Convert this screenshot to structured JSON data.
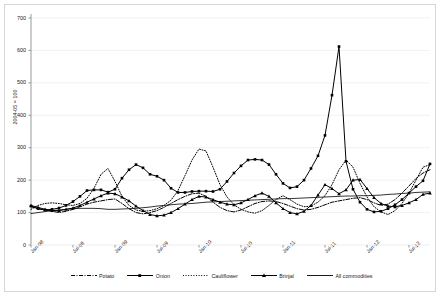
{
  "chart_data": {
    "type": "line",
    "title": "",
    "xlabel": "",
    "ylabel": "2004-05 = 100",
    "ylim": [
      0,
      700
    ],
    "yticks": [
      0,
      100,
      200,
      300,
      400,
      500,
      600,
      700
    ],
    "grid": true,
    "legend_position": "bottom",
    "x_tick_labels": [
      "Jan-08",
      "Jul-08",
      "Jan-09",
      "Jul-09",
      "Jan-10",
      "Jul-10",
      "Jan-11",
      "Jul-11",
      "Jan-12",
      "Jul-12"
    ],
    "x_tick_indices": [
      0,
      6,
      12,
      18,
      24,
      30,
      36,
      42,
      48,
      54
    ],
    "x": [
      "Jan-08",
      "Feb-08",
      "Mar-08",
      "Apr-08",
      "May-08",
      "Jun-08",
      "Jul-08",
      "Aug-08",
      "Sep-08",
      "Oct-08",
      "Nov-08",
      "Dec-08",
      "Jan-09",
      "Feb-09",
      "Mar-09",
      "Apr-09",
      "May-09",
      "Jun-09",
      "Jul-09",
      "Aug-09",
      "Sep-09",
      "Oct-09",
      "Nov-09",
      "Dec-09",
      "Jan-10",
      "Feb-10",
      "Mar-10",
      "Apr-10",
      "May-10",
      "Jun-10",
      "Jul-10",
      "Aug-10",
      "Sep-10",
      "Oct-10",
      "Nov-10",
      "Dec-10",
      "Jan-11",
      "Feb-11",
      "Mar-11",
      "Apr-11",
      "May-11",
      "Jun-11",
      "Jul-11",
      "Aug-11",
      "Sep-11",
      "Oct-11",
      "Nov-11",
      "Dec-11",
      "Jan-12",
      "Feb-12",
      "Mar-12",
      "Apr-12",
      "May-12",
      "Jun-12",
      "Jul-12",
      "Aug-12",
      "Sep-12",
      "Oct-12"
    ],
    "series": [
      {
        "name": "Potato",
        "style": "dash-dot",
        "marker": "none",
        "values": [
          118,
          112,
          108,
          104,
          100,
          104,
          110,
          118,
          126,
          132,
          136,
          140,
          142,
          128,
          112,
          100,
          96,
          100,
          106,
          116,
          128,
          140,
          150,
          158,
          160,
          150,
          132,
          116,
          106,
          102,
          108,
          118,
          128,
          134,
          136,
          134,
          128,
          120,
          112,
          108,
          110,
          116,
          124,
          132,
          136,
          140,
          144,
          146,
          140,
          130,
          122,
          126,
          140,
          160,
          182,
          205,
          222,
          232
        ]
      },
      {
        "name": "Onion",
        "style": "solid",
        "marker": "square",
        "values": [
          120,
          112,
          108,
          110,
          114,
          122,
          134,
          150,
          168,
          170,
          170,
          163,
          172,
          206,
          232,
          248,
          238,
          218,
          212,
          200,
          175,
          162,
          162,
          165,
          166,
          166,
          165,
          172,
          196,
          222,
          244,
          262,
          264,
          262,
          248,
          218,
          190,
          176,
          180,
          200,
          236,
          275,
          338,
          462,
          612,
          258,
          172,
          132,
          110,
          102,
          104,
          112,
          124,
          140,
          160,
          180,
          198,
          250
        ]
      },
      {
        "name": "Cauliflower",
        "style": "dotted",
        "marker": "none",
        "values": [
          110,
          122,
          128,
          130,
          128,
          124,
          122,
          128,
          144,
          175,
          218,
          236,
          196,
          150,
          122,
          108,
          104,
          106,
          112,
          122,
          138,
          168,
          214,
          262,
          296,
          290,
          240,
          186,
          148,
          124,
          110,
          102,
          98,
          106,
          122,
          140,
          152,
          140,
          126,
          118,
          120,
          132,
          152,
          186,
          232,
          262,
          240,
          190,
          148,
          118,
          102,
          94,
          106,
          128,
          160,
          200,
          240,
          248
        ]
      },
      {
        "name": "Brinjal",
        "style": "solid",
        "marker": "triangle",
        "values": [
          122,
          116,
          110,
          106,
          106,
          110,
          114,
          122,
          132,
          142,
          152,
          160,
          158,
          148,
          136,
          120,
          106,
          94,
          90,
          92,
          100,
          112,
          126,
          140,
          150,
          148,
          140,
          132,
          126,
          124,
          130,
          140,
          152,
          160,
          150,
          130,
          112,
          100,
          96,
          104,
          122,
          154,
          186,
          174,
          158,
          170,
          200,
          202,
          174,
          146,
          128,
          120,
          118,
          122,
          130,
          140,
          156,
          160
        ]
      },
      {
        "name": "All commodities",
        "style": "solid",
        "marker": "none",
        "values": [
          97,
          100,
          103,
          106,
          108,
          110,
          112,
          113,
          113,
          113,
          112,
          110,
          110,
          111,
          112,
          113,
          115,
          117,
          120,
          122,
          124,
          126,
          127,
          128,
          130,
          132,
          133,
          134,
          135,
          136,
          137,
          138,
          139,
          140,
          141,
          142,
          143,
          143,
          144,
          145,
          146,
          147,
          148,
          149,
          150,
          151,
          151,
          152,
          152,
          153,
          154,
          156,
          157,
          159,
          160,
          162,
          163,
          164
        ]
      }
    ]
  },
  "legend": {
    "items": [
      {
        "label": "Potato"
      },
      {
        "label": "Onion"
      },
      {
        "label": "Cauliflower"
      },
      {
        "label": "Brinjal"
      },
      {
        "label": "All commodities"
      }
    ]
  },
  "colors": {
    "line": "#000000",
    "axis": "#808080",
    "grid": "#e8e8e8",
    "text": "#1a1a1a",
    "frame": "#d8d8d8",
    "background": "#ffffff"
  }
}
